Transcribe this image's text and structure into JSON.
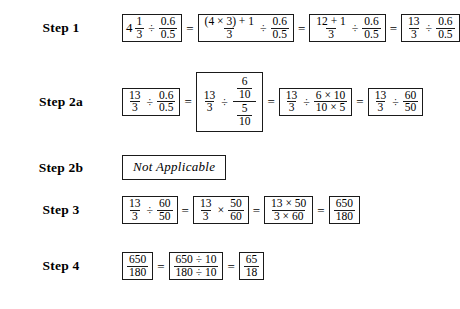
{
  "document": {
    "type": "math-worksheet",
    "title_present": false
  },
  "steps": [
    {
      "label": "Step 1",
      "name": "step-1",
      "expressions": [
        {
          "id": "s1e1",
          "kind": "mixed-divide-fraction",
          "whole": "4",
          "frac_num": "1",
          "frac_den": "3",
          "operator": "÷",
          "right_num": "0.6",
          "right_den": "0.5"
        },
        {
          "id": "s1e2",
          "kind": "fraction-divide-fraction",
          "left_num": "(4 × 3) + 1",
          "left_den": "3",
          "operator": "÷",
          "right_num": "0.6",
          "right_den": "0.5"
        },
        {
          "id": "s1e3",
          "kind": "fraction-divide-fraction",
          "left_num": "12 + 1",
          "left_den": "3",
          "operator": "÷",
          "right_num": "0.6",
          "right_den": "0.5"
        },
        {
          "id": "s1e4",
          "kind": "fraction-divide-fraction",
          "left_num": "13",
          "left_den": "3",
          "operator": "÷",
          "right_num": "0.6",
          "right_den": "0.5"
        }
      ]
    },
    {
      "label": "Step 2a",
      "name": "step-2a",
      "expressions": [
        {
          "id": "s2ae1",
          "kind": "fraction-divide-fraction",
          "left_num": "13",
          "left_den": "3",
          "operator": "÷",
          "right_num": "0.6",
          "right_den": "0.5"
        },
        {
          "id": "s2ae2",
          "kind": "fraction-divide-complex-fraction",
          "left_num": "13",
          "left_den": "3",
          "operator": "÷",
          "cnum_num": "6",
          "cnum_den": "10",
          "cden_num": "5",
          "cden_den": "10"
        },
        {
          "id": "s2ae3",
          "kind": "fraction-divide-fraction",
          "left_num": "13",
          "left_den": "3",
          "operator": "÷",
          "right_num": "6 × 10",
          "right_den": "10 × 5"
        },
        {
          "id": "s2ae4",
          "kind": "fraction-divide-fraction",
          "left_num": "13",
          "left_den": "3",
          "operator": "÷",
          "right_num": "60",
          "right_den": "50"
        }
      ]
    },
    {
      "label": "Step 2b",
      "name": "step-2b",
      "expressions": [
        {
          "id": "s2be1",
          "kind": "text",
          "text": "Not Applicable"
        }
      ]
    },
    {
      "label": "Step 3",
      "name": "step-3",
      "expressions": [
        {
          "id": "s3e1",
          "kind": "fraction-divide-fraction",
          "left_num": "13",
          "left_den": "3",
          "operator": "÷",
          "right_num": "60",
          "right_den": "50"
        },
        {
          "id": "s3e2",
          "kind": "fraction-times-fraction",
          "left_num": "13",
          "left_den": "3",
          "operator": "×",
          "right_num": "50",
          "right_den": "60"
        },
        {
          "id": "s3e3",
          "kind": "single-fraction",
          "num": "13 × 50",
          "den": "3 × 60"
        },
        {
          "id": "s3e4",
          "kind": "single-fraction",
          "num": "650",
          "den": "180"
        }
      ]
    },
    {
      "label": "Step 4",
      "name": "step-4",
      "expressions": [
        {
          "id": "s4e1",
          "kind": "single-fraction",
          "num": "650",
          "den": "180"
        },
        {
          "id": "s4e2",
          "kind": "single-fraction",
          "num": "650 ÷ 10",
          "den": "180 ÷ 10"
        },
        {
          "id": "s4e3",
          "kind": "single-fraction",
          "num": "65",
          "den": "18"
        }
      ]
    }
  ],
  "symbols": {
    "equals": "=",
    "divide": "÷",
    "times": "×"
  },
  "colors": {
    "text": "#000000",
    "box_border": "#1a1a1a",
    "background": "#ffffff"
  }
}
